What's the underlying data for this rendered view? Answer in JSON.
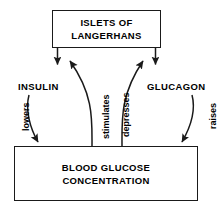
{
  "diagram": {
    "title_box": {
      "name": "islets-of-langerhans",
      "lines": [
        "ISLETS OF",
        "LANGERHANS"
      ]
    },
    "target_box": {
      "name": "blood-glucose-concentration",
      "lines": [
        "BLOOD GLUCOSE",
        "CONCENTRATION"
      ]
    },
    "hormones": [
      {
        "id": "insulin",
        "label": "INSULIN"
      },
      {
        "id": "glucagon",
        "label": "GLUCAGON"
      }
    ],
    "effects": [
      {
        "id": "lowers",
        "label": "lowers",
        "from": "INSULIN",
        "to": "BLOOD GLUCOSE CONCENTRATION"
      },
      {
        "id": "stimulates",
        "label": "stimulates",
        "from": "BLOOD GLUCOSE CONCENTRATION",
        "to": "ISLETS OF LANGERHANS"
      },
      {
        "id": "depresses",
        "label": "depresses",
        "from": "BLOOD GLUCOSE CONCENTRATION",
        "to": "ISLETS OF LANGERHANS"
      },
      {
        "id": "raises",
        "label": "raises",
        "from": "GLUCAGON",
        "to": "BLOOD GLUCOSE CONCENTRATION"
      }
    ],
    "colors": {
      "stroke": "#1a1a1a",
      "text": "#000000",
      "background": "#ffffff"
    }
  }
}
